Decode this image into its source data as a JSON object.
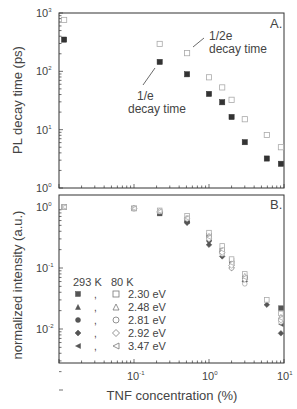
{
  "chart_data": [
    {
      "panel": "A.",
      "type": "scatter",
      "title": "",
      "xlabel": "",
      "ylabel": "PL decay time (ps)",
      "xscale": "log",
      "yscale": "log",
      "xlim": [
        0.01,
        10
      ],
      "ylim": [
        1,
        1000
      ],
      "y_ticks": [
        "10^0",
        "10^1",
        "10^2",
        "10^3"
      ],
      "grid": false,
      "annotations": [
        "1/e decay time",
        "1/2e decay time"
      ],
      "series": [
        {
          "name": "1/e decay time",
          "marker": "filled-square",
          "x": [
            0.0117,
            0.22,
            0.51,
            1.0,
            1.5,
            2.0,
            3.0,
            5.9,
            9.1
          ],
          "y": [
            350,
            145,
            89,
            41,
            29.5,
            16.5,
            6.1,
            3.2,
            2.6
          ]
        },
        {
          "name": "1/2e decay time",
          "marker": "open-square",
          "x": [
            0.0117,
            0.22,
            0.51,
            1.0,
            1.5,
            2.0,
            3.0,
            5.9,
            9.1
          ],
          "y": [
            760,
            295,
            205,
            79,
            53,
            32.5,
            15.1,
            8.1,
            5.0
          ]
        }
      ]
    },
    {
      "panel": "B.",
      "type": "scatter",
      "title": "",
      "xlabel": "TNF concentration (%)",
      "ylabel": "normalized intensity (a.u.)",
      "xscale": "log",
      "yscale": "log",
      "xlim": [
        0.01,
        10
      ],
      "ylim": [
        0.0028,
        1.1
      ],
      "x_ticks": [
        "10^-1",
        "10^0",
        "10^1"
      ],
      "y_ticks": [
        "10^0",
        "10^-1",
        "10^-2"
      ],
      "grid": false,
      "legend": {
        "position": "lower-left",
        "headers": [
          "293 K",
          "80 K"
        ],
        "entries": [
          "2.30 eV",
          "2.48 eV",
          "2.81 eV",
          "2.92 eV",
          "3.47 eV"
        ]
      },
      "series": [
        {
          "name": "293 K 2.30 eV",
          "marker": "filled-square",
          "x": [
            0.0117,
            0.1,
            0.22,
            0.51,
            1.0,
            1.5,
            2.0,
            3.0,
            9.1
          ],
          "y": [
            1.0,
            0.95,
            0.78,
            0.62,
            0.34,
            0.19,
            0.13,
            0.068,
            0.022
          ]
        },
        {
          "name": "293 K 2.48 eV",
          "marker": "filled-triangle",
          "x": [
            0.0117,
            0.1,
            0.22,
            0.51,
            1.0,
            1.5,
            2.0,
            3.0,
            9.1
          ],
          "y": [
            1.0,
            0.95,
            0.8,
            0.6,
            0.3,
            0.2,
            0.12,
            0.075,
            0.016
          ]
        },
        {
          "name": "293 K 2.81 eV",
          "marker": "filled-circle",
          "x": [
            0.0117,
            0.1,
            0.22,
            0.51,
            1.0,
            1.5,
            2.0,
            3.0,
            9.1
          ],
          "y": [
            1.0,
            0.95,
            0.8,
            0.58,
            0.28,
            0.18,
            0.11,
            0.07,
            0.014
          ]
        },
        {
          "name": "293 K 2.92 eV",
          "marker": "filled-diamond",
          "x": [
            0.0117,
            0.1,
            0.22,
            0.51,
            1.0,
            1.5,
            2.0,
            3.0,
            5.9,
            9.1
          ],
          "y": [
            1.0,
            0.95,
            0.8,
            0.55,
            0.24,
            0.155,
            0.1,
            0.06,
            0.025,
            0.0085
          ]
        },
        {
          "name": "293 K 3.47 eV",
          "marker": "filled-triangle-left",
          "x": [
            0.0117,
            0.1,
            0.22,
            0.51,
            1.0,
            1.5,
            2.0,
            3.0,
            9.1
          ],
          "y": [
            1.0,
            0.95,
            0.8,
            0.58,
            0.3,
            0.19,
            0.12,
            0.07,
            0.012
          ]
        },
        {
          "name": "80 K 2.30 eV",
          "marker": "open-square",
          "x": [
            0.0117,
            0.1,
            0.22,
            0.51,
            1.0,
            1.5,
            2.0,
            3.0,
            5.9,
            9.1
          ],
          "y": [
            1.0,
            0.95,
            0.88,
            0.72,
            0.38,
            0.23,
            0.14,
            0.08,
            0.03,
            0.018
          ]
        },
        {
          "name": "80 K 2.48 eV",
          "marker": "open-triangle",
          "x": [
            0.0117,
            0.1,
            0.22,
            0.51,
            1.0,
            1.5,
            2.0,
            3.0,
            9.1
          ],
          "y": [
            1.0,
            0.95,
            0.85,
            0.66,
            0.34,
            0.2,
            0.12,
            0.075,
            0.016
          ]
        },
        {
          "name": "80 K 2.81 eV",
          "marker": "open-circle",
          "x": [
            0.0117,
            0.1,
            0.22,
            0.51,
            1.0,
            1.5,
            2.0,
            3.0,
            9.1
          ],
          "y": [
            1.0,
            0.95,
            0.85,
            0.66,
            0.31,
            0.17,
            0.1,
            0.055,
            0.013
          ]
        },
        {
          "name": "80 K 2.92 eV",
          "marker": "open-diamond",
          "x": [
            0.0117,
            0.1,
            0.22,
            0.51,
            1.0,
            1.5,
            2.0,
            3.0,
            9.1
          ],
          "y": [
            1.0,
            0.95,
            0.85,
            0.64,
            0.3,
            0.18,
            0.11,
            0.065,
            0.014
          ]
        },
        {
          "name": "80 K 3.47 eV",
          "marker": "open-triangle-left",
          "x": [
            0.0117,
            0.1,
            0.22,
            0.51,
            1.0,
            1.5,
            2.0,
            3.0,
            9.1
          ],
          "y": [
            1.0,
            0.95,
            0.85,
            0.66,
            0.32,
            0.2,
            0.12,
            0.07,
            0.015
          ]
        }
      ]
    }
  ],
  "panel_a": {
    "label": "A.",
    "ylabel": "PL decay time (ps)",
    "ytick_labels": [
      "10",
      "10",
      "10",
      "10"
    ],
    "ytick_exps": [
      "3",
      "2",
      "1",
      "0"
    ],
    "annot_1e_line1": "1/e",
    "annot_1e_line2": "decay time",
    "annot_2e_line1": "1/2e",
    "annot_2e_line2": "decay time"
  },
  "panel_b": {
    "label": "B.",
    "ylabel": "normalized intensity (a.u.)",
    "xlabel": "TNF concentration (%)",
    "ytick_labels": [
      "10",
      "10",
      "10"
    ],
    "ytick_exps": [
      "0",
      "-1",
      "-2"
    ],
    "xtick_labels": [
      "10",
      "10",
      "10"
    ],
    "xtick_exps": [
      "-1",
      "0",
      "1"
    ],
    "legend": {
      "header_293": "293 K",
      "header_80": "80 K",
      "entries": [
        "2.30 eV",
        "2.48 eV",
        "2.81 eV",
        "2.92 eV",
        "3.47 eV"
      ],
      "separator": ","
    }
  },
  "colors": {
    "axis": "#333333",
    "filled": "#333333",
    "filled_b": "#555555",
    "open": "#aaaaaa",
    "text": "#444444"
  }
}
